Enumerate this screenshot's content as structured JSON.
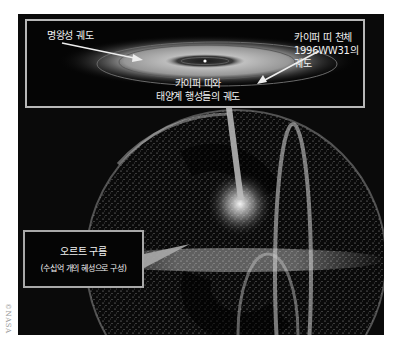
{
  "figure": {
    "inset": {
      "labels": {
        "pluto_orbit": "명왕성 궤도",
        "kbo_line1": "카이퍼 띠 천체",
        "kbo_line2": "1996WW31의",
        "kbo_line3": "궤도",
        "kuiper_line1": "카이퍼 띠와",
        "kuiper_line2": "태양계 행성들의 궤도"
      }
    },
    "oort": {
      "title": "오르트 구름",
      "subtitle": "(수십억 개의 혜성으로 구성)"
    },
    "credit": "©NASA",
    "colors": {
      "background": "#0a0a0a",
      "frame": "#b8b8b8",
      "text": "#f2f2f2",
      "page": "#ffffff"
    }
  }
}
